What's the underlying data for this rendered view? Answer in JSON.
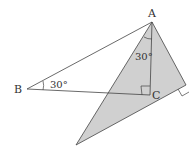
{
  "diagram": {
    "type": "geometry",
    "points": {
      "A": {
        "label": "A",
        "x": 152,
        "y": 22
      },
      "B": {
        "label": "B",
        "x": 27,
        "y": 89
      },
      "C": {
        "label": "C",
        "x": 150,
        "y": 95
      },
      "D": {
        "x": 186,
        "y": 85
      },
      "E": {
        "x": 76,
        "y": 145
      }
    },
    "angles": {
      "B": {
        "label": "30°"
      },
      "A": {
        "label": "30°"
      }
    },
    "right_angles": [
      "C",
      "D"
    ],
    "shaded_region": "triangle A-D-E",
    "colors": {
      "shade": "#d0d0d0",
      "stroke": "#444444"
    }
  }
}
